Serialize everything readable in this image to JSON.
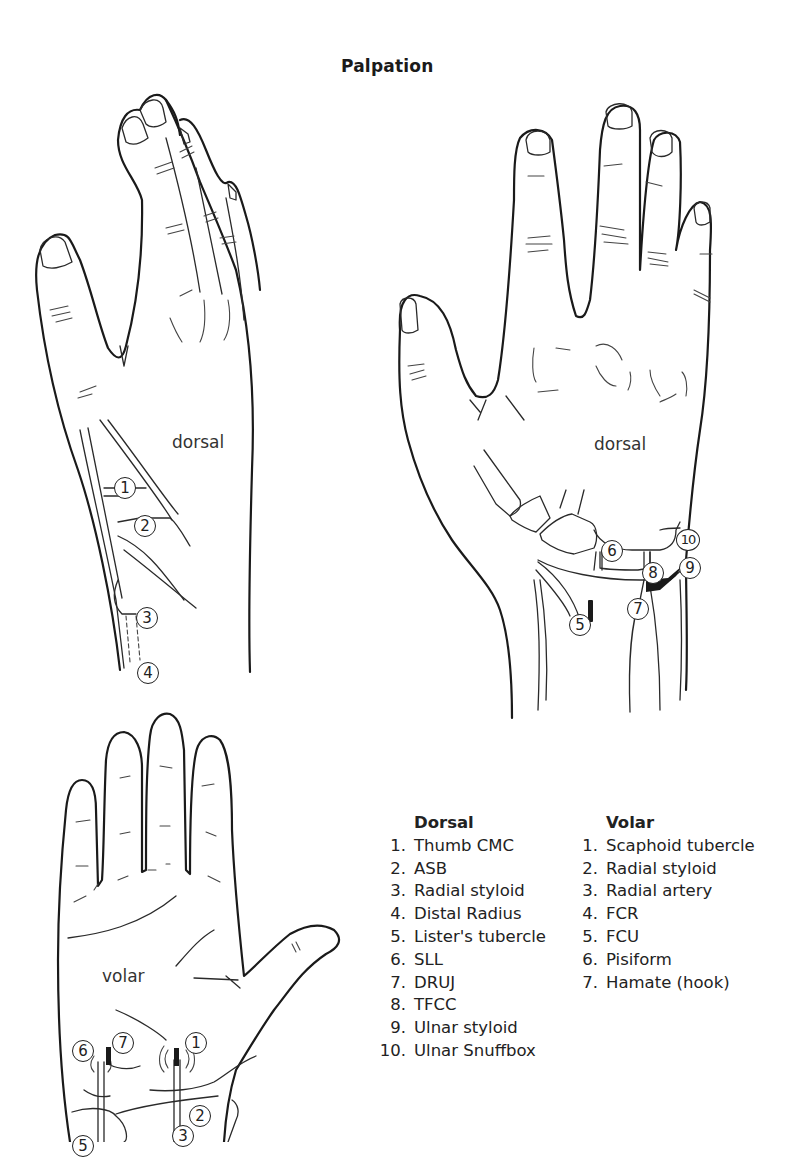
{
  "figure": {
    "title": "Palpation",
    "views": [
      {
        "id": "dorsal-left",
        "label": "dorsal",
        "markers": [
          "1",
          "2",
          "3",
          "4"
        ]
      },
      {
        "id": "dorsal-right",
        "label": "dorsal",
        "markers": [
          "5",
          "6",
          "7",
          "8",
          "9",
          "10"
        ]
      },
      {
        "id": "volar",
        "label": "volar",
        "markers": [
          "1",
          "2",
          "3",
          "5",
          "6",
          "7"
        ]
      }
    ]
  },
  "legend": {
    "dorsal": {
      "header": "Dorsal",
      "items": [
        {
          "num": "1.",
          "label": "Thumb CMC"
        },
        {
          "num": "2.",
          "label": "ASB"
        },
        {
          "num": "3.",
          "label": "Radial styloid"
        },
        {
          "num": "4.",
          "label": "Distal Radius"
        },
        {
          "num": "5.",
          "label": "Lister's tubercle"
        },
        {
          "num": "6.",
          "label": "SLL"
        },
        {
          "num": "7.",
          "label": "DRUJ"
        },
        {
          "num": "8.",
          "label": "TFCC"
        },
        {
          "num": "9.",
          "label": "Ulnar styloid"
        },
        {
          "num": "10.",
          "label": "Ulnar Snuffbox"
        }
      ]
    },
    "volar": {
      "header": "Volar",
      "items": [
        {
          "num": "1.",
          "label": "Scaphoid tubercle"
        },
        {
          "num": "2.",
          "label": "Radial styloid"
        },
        {
          "num": "3.",
          "label": "Radial artery"
        },
        {
          "num": "4.",
          "label": "FCR"
        },
        {
          "num": "5.",
          "label": "FCU"
        },
        {
          "num": "6.",
          "label": "Pisiform"
        },
        {
          "num": "7.",
          "label": "Hamate (hook)"
        }
      ]
    }
  }
}
